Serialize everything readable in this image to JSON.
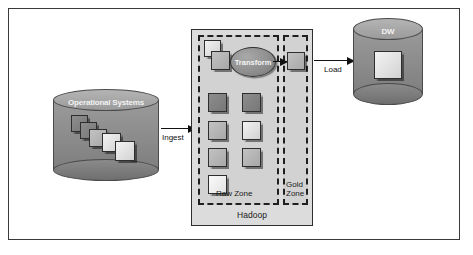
{
  "diagram": {
    "source": {
      "label": "Operational Systems",
      "shape": "cylinder",
      "card_count": 5
    },
    "target": {
      "label": "DW",
      "shape": "cylinder"
    },
    "platform": {
      "label": "Hadoop"
    },
    "zones": [
      {
        "name": "raw-zone",
        "label": "Raw Zone"
      },
      {
        "name": "gold-zone",
        "label_line1": "Gold",
        "label_line2": "Zone"
      }
    ],
    "process": {
      "label": "Transform",
      "shape": "ellipse"
    },
    "arrows": [
      {
        "name": "ingest-arrow",
        "label": "Ingest",
        "from": "Operational Systems",
        "to": "Raw Zone"
      },
      {
        "name": "transform-arrow",
        "label": "",
        "from": "Transform",
        "to": "Gold Zone"
      },
      {
        "name": "load-arrow",
        "label": "Load",
        "from": "Gold Zone",
        "to": "DW"
      }
    ],
    "raw_zone_blocks": [
      {
        "name": "block-r1c1",
        "tone": "dark"
      },
      {
        "name": "block-r1c2",
        "tone": "dark"
      },
      {
        "name": "block-r2c1",
        "tone": "mid"
      },
      {
        "name": "block-r2c2",
        "tone": "light"
      },
      {
        "name": "block-r3c1",
        "tone": "mid"
      },
      {
        "name": "block-r3c2",
        "tone": "mid"
      },
      {
        "name": "block-r4c1",
        "tone": "light"
      }
    ],
    "staged_blocks": [
      {
        "name": "staged-block-back",
        "tone": "light"
      },
      {
        "name": "staged-block-front",
        "tone": "mid"
      }
    ],
    "gold_block": {
      "name": "gold-block",
      "tone": "mid"
    },
    "dw_block": {
      "name": "dw-block",
      "tone": "light"
    },
    "colors": {
      "frame_border": "#3a3a3a",
      "platform_fill": "#dcdcdc",
      "zone_fill": "#d2d2d2",
      "zone_border": "#1f1f1f",
      "cylinder_fill": "#8e8e8e",
      "arrow": "#111111"
    }
  }
}
